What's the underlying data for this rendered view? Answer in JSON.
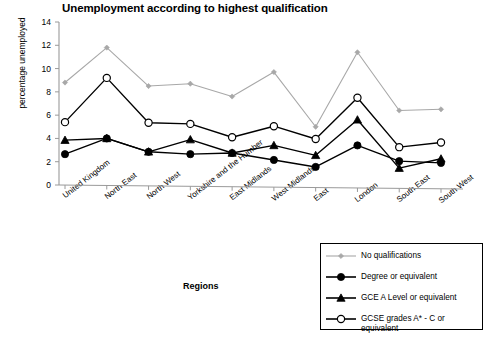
{
  "chart_data": {
    "type": "line",
    "title": "Unemployment according to highest qualification",
    "xlabel": "Regions",
    "ylabel": "percentage unemployed",
    "ylim": [
      0,
      14
    ],
    "yticks": [
      0,
      2,
      4,
      6,
      8,
      10,
      12,
      14
    ],
    "grid": false,
    "legend_position": "bottom-right",
    "categories": [
      "United Kingdom",
      "North East",
      "North West",
      "Yorkshire and the Humber",
      "East Midlands",
      "West Midlands",
      "East",
      "London",
      "South East",
      "South West"
    ],
    "series": [
      {
        "name": "No qualifications",
        "marker": "diamond",
        "color": "#a8a8a8",
        "values": [
          8.8,
          11.8,
          8.5,
          8.7,
          7.6,
          9.7,
          5.0,
          11.4,
          6.4,
          6.5
        ]
      },
      {
        "name": "Degree or equivalent",
        "marker": "filled-circle",
        "color": "#000000",
        "values": [
          2.65,
          4.0,
          2.85,
          2.65,
          2.75,
          2.15,
          1.55,
          3.4,
          2.05,
          1.9
        ]
      },
      {
        "name": "GCE A Level or equivalent",
        "marker": "filled-triangle",
        "color": "#000000",
        "values": [
          3.85,
          4.0,
          2.85,
          3.9,
          2.75,
          3.4,
          2.55,
          5.6,
          1.45,
          2.25
        ]
      },
      {
        "name": "GCSE grades A* - C or equivalent",
        "marker": "open-circle",
        "color": "#000000",
        "values": [
          5.4,
          9.2,
          5.35,
          5.25,
          4.1,
          5.05,
          3.95,
          7.5,
          3.25,
          3.65
        ]
      }
    ]
  },
  "legend": {
    "items": [
      {
        "label": "No qualifications",
        "marker": "diamond-marker"
      },
      {
        "label": "Degree or equivalent",
        "marker": "filled-circle-marker"
      },
      {
        "label": "GCE A Level or equivalent",
        "marker": "filled-triangle-marker"
      },
      {
        "label": "GCSE grades A* - C or\nequivalent",
        "marker": "open-circle-marker"
      }
    ]
  }
}
